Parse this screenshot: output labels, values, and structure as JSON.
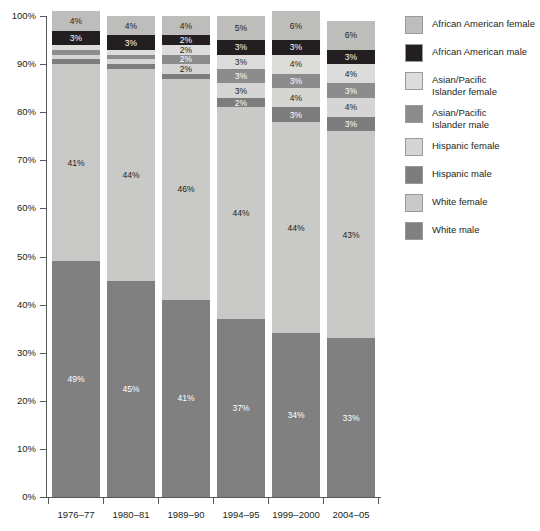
{
  "chart_data": {
    "type": "bar",
    "subtype": "stacked-bar-100-percent",
    "title": "",
    "subtitle": "",
    "xlabel": "",
    "ylabel": "",
    "ylim": [
      0,
      100
    ],
    "y_unit": "%",
    "grid": false,
    "legend_position": "right",
    "categories": [
      "1976–77",
      "1980–81",
      "1989–90",
      "1994–95",
      "1999–2000",
      "2004–05"
    ],
    "y_ticks": [
      "0%",
      "10%",
      "20%",
      "30%",
      "40%",
      "50%",
      "60%",
      "70%",
      "80%",
      "90%",
      "100%"
    ],
    "y_tick_values": [
      0,
      10,
      20,
      30,
      40,
      50,
      60,
      70,
      80,
      90,
      100
    ],
    "stack_order_bottom_to_top": [
      "White male",
      "White female",
      "Hispanic male",
      "Hispanic female",
      "Asian/Pacific Islander male",
      "Asian/Pacific Islander female",
      "African American male",
      "African American female"
    ],
    "series": [
      {
        "name": "White male",
        "color": "#808080",
        "label_color": "#ffffff",
        "values": [
          49,
          45,
          41,
          37,
          34,
          33
        ],
        "labels": [
          "49%",
          "45%",
          "41%",
          "37%",
          "34%",
          "33%"
        ]
      },
      {
        "name": "White female",
        "color": "#c9c9c7",
        "label_color": "#231f20",
        "values": [
          41,
          44,
          46,
          44,
          44,
          43
        ],
        "labels": [
          "41%",
          "44%",
          "46%",
          "44%",
          "44%",
          "43%"
        ]
      },
      {
        "name": "Hispanic male",
        "color": "#7d7d7d",
        "label_color": "#ffffff",
        "values": [
          1,
          1,
          1,
          2,
          3,
          3
        ],
        "labels": [
          "1%",
          "1%",
          "1%",
          "2%",
          "3%",
          "3%"
        ]
      },
      {
        "name": "Hispanic female",
        "color": "#d5d5d3",
        "label_color": "#231f20",
        "values": [
          1,
          1,
          2,
          3,
          4,
          4
        ],
        "labels": [
          "1%",
          "1%",
          "2%",
          "3%",
          "4%",
          "4%"
        ]
      },
      {
        "name": "Asian/Pacific Islander male",
        "color": "#8c8c8c",
        "label_color": "#ffffff",
        "values": [
          1,
          1,
          2,
          3,
          3,
          3
        ],
        "labels": [
          "1%",
          "1%",
          "2%",
          "3%",
          "3%",
          "3%"
        ]
      },
      {
        "name": "Asian/Pacific Islander female",
        "color": "#dcdcda",
        "label_color": "#231f20",
        "values": [
          1,
          1,
          2,
          3,
          4,
          4
        ],
        "labels": [
          "1%",
          "1%",
          "2%",
          "3%",
          "4%",
          "4%"
        ]
      },
      {
        "name": "African American male",
        "color": "#231f20",
        "label_color": "#ffffff",
        "values": [
          3,
          3,
          2,
          3,
          3,
          3
        ],
        "labels": [
          "3%",
          "3%",
          "2%",
          "3%",
          "3%",
          "3%"
        ]
      },
      {
        "name": "African American female",
        "color": "#bdbdbb",
        "label_color": "#231f20",
        "values": [
          4,
          4,
          4,
          5,
          6,
          6
        ],
        "labels": [
          "4%",
          "4%",
          "4%",
          "5%",
          "6%",
          "6%"
        ]
      }
    ]
  },
  "legend": {
    "items": [
      {
        "label": "African American female",
        "color": "#bdbdbb"
      },
      {
        "label": "African American male",
        "color": "#231f20"
      },
      {
        "label": "Asian/Pacific\nIslander female",
        "color": "#dcdcda"
      },
      {
        "label": "Asian/Pacific\nIslander male",
        "color": "#8c8c8c"
      },
      {
        "label": "Hispanic female",
        "color": "#d5d5d3"
      },
      {
        "label": "Hispanic male",
        "color": "#7d7d7d"
      },
      {
        "label": "White female",
        "color": "#c9c9c7"
      },
      {
        "label": "White male",
        "color": "#808080"
      }
    ]
  },
  "axis": {
    "y_ticks": [
      "100%",
      "90%",
      "80%",
      "70%",
      "60%",
      "50%",
      "40%",
      "30%",
      "20%",
      "10%",
      "0%"
    ],
    "x_ticks": [
      "1976–77",
      "1980–81",
      "1989–90",
      "1994–95",
      "1999–2000",
      "2004–05"
    ]
  }
}
